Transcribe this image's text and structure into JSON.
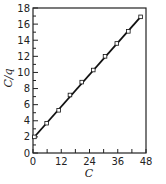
{
  "chart_data": {
    "type": "line",
    "title": "",
    "xlabel": "C",
    "ylabel": "C/q",
    "xlim": [
      0,
      48
    ],
    "ylim": [
      0,
      18
    ],
    "x_ticks": [
      0,
      12,
      24,
      36,
      48
    ],
    "x_minor_step": 6,
    "y_ticks": [
      0,
      2,
      4,
      6,
      8,
      10,
      12,
      14,
      16,
      18
    ],
    "y_minor_step": 1,
    "grid": false,
    "legend": null,
    "series": [
      {
        "name": "data",
        "marker": "open-square",
        "line": "linear-fit",
        "x": [
          0.6,
          5.8,
          10.9,
          15.7,
          20.7,
          25.6,
          30.6,
          35.6,
          40.5,
          45.7
        ],
        "y": [
          2.0,
          3.7,
          5.3,
          7.2,
          8.8,
          10.3,
          12.0,
          13.6,
          15.1,
          16.9
        ]
      }
    ],
    "fit": {
      "slope": 0.33,
      "intercept": 1.8,
      "x_range": [
        0,
        46
      ]
    }
  },
  "colors": {
    "line": "#111111",
    "axis": "#222222",
    "marker_fill": "#ffffff"
  }
}
